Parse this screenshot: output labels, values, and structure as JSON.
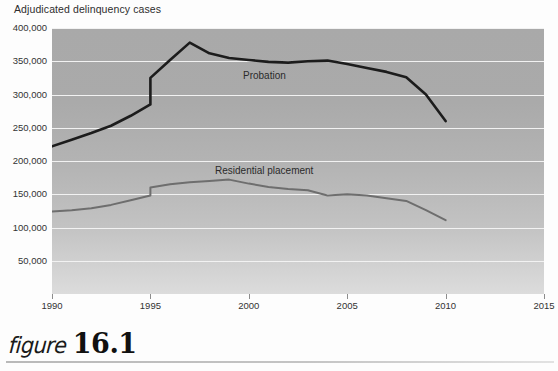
{
  "chart_title": "Adjudicated delinquency cases",
  "caption": {
    "word": "figure",
    "number": "16.1"
  },
  "colors": {
    "probation_line": "#1c1c1c",
    "residential_line": "#6e6e6e",
    "gridline": "#f2f2f2",
    "plot_bg_top": "#a9a9a9",
    "plot_bg_bottom": "#dcdcdc",
    "axis_text": "#333333"
  },
  "axes": {
    "y_ticks": [
      "400,000",
      "350,000",
      "300,000",
      "250,000",
      "200,000",
      "150,000",
      "100,000",
      "50,000"
    ],
    "x_ticks": [
      "1990",
      "1995",
      "2000",
      "2005",
      "2010",
      "2015"
    ]
  },
  "series_labels": {
    "probation": "Probation",
    "residential": "Residential placement"
  },
  "chart_data": {
    "type": "line",
    "title": "Adjudicated delinquency cases",
    "xlabel": "",
    "ylabel": "Adjudicated delinquency cases",
    "xlim": [
      1990,
      2015
    ],
    "ylim": [
      0,
      400000
    ],
    "ytick_values": [
      50000,
      100000,
      150000,
      200000,
      250000,
      300000,
      350000,
      400000
    ],
    "xtick_values": [
      1990,
      1995,
      2000,
      2005,
      2010,
      2015
    ],
    "grid": "horizontal",
    "legend": "inline-labels",
    "series": [
      {
        "name": "Probation",
        "color": "#1c1c1c",
        "x": [
          1990,
          1991,
          1992,
          1993,
          1994,
          1995,
          1995,
          1996,
          1997,
          1998,
          1999,
          2000,
          2001,
          2002,
          2003,
          2004,
          2005,
          2006,
          2007,
          2008,
          2009,
          2010
        ],
        "values": [
          222000,
          232000,
          242000,
          253000,
          268000,
          285000,
          325000,
          352000,
          378000,
          362000,
          355000,
          352000,
          349000,
          348000,
          350000,
          351000,
          346000,
          340000,
          334000,
          326000,
          300000,
          260000
        ]
      },
      {
        "name": "Residential placement",
        "color": "#6e6e6e",
        "x": [
          1990,
          1991,
          1992,
          1993,
          1994,
          1995,
          1995,
          1996,
          1997,
          1998,
          1999,
          2000,
          2001,
          2002,
          2003,
          2004,
          2005,
          2006,
          2007,
          2008,
          2009,
          2010
        ],
        "values": [
          124000,
          126000,
          129000,
          134000,
          141000,
          148000,
          160000,
          165000,
          168000,
          170000,
          172000,
          166000,
          161000,
          158000,
          156000,
          148000,
          150000,
          148000,
          144000,
          140000,
          126000,
          111000
        ]
      }
    ]
  }
}
